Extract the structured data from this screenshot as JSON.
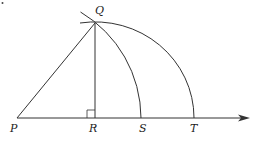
{
  "diagram": {
    "type": "geometric construction",
    "points": {
      "P": {
        "label": "P"
      },
      "Q": {
        "label": "Q"
      },
      "R": {
        "label": "R"
      },
      "S": {
        "label": "S"
      },
      "T": {
        "label": "T"
      }
    },
    "segments": [
      "PQ",
      "QR",
      "PT (ray with arrow)"
    ],
    "arcs": [
      "arc centered at P through Q and S",
      "arc centered at R through Q and T"
    ],
    "markers": [
      "right angle at R"
    ],
    "colors": {
      "stroke": "#333333",
      "text": "#222222",
      "background": "#ffffff"
    }
  }
}
